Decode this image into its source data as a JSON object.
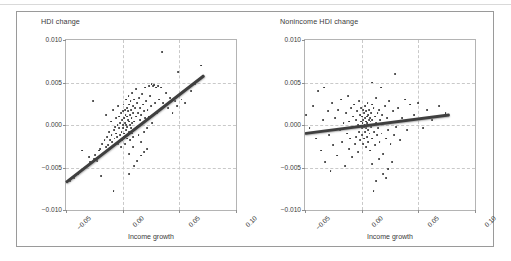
{
  "figure": {
    "border_color": "#9a9a9a",
    "background": "#ffffff",
    "point_color": "#2b2b2b",
    "trend_color": "#3f3f3f",
    "grid_color": "#c9c9c9"
  },
  "panels": [
    {
      "id": "hdi-change",
      "title": "HDI change",
      "xlabel": "Income growth",
      "yticks": [
        "0.010",
        "0.005",
        "0.000",
        "−0.005",
        "−0.010"
      ],
      "ytick_values": [
        0.01,
        0.005,
        0.0,
        -0.005,
        -0.01
      ],
      "xticks": [
        "−0.05",
        "0.00",
        "0.05",
        "0.10"
      ],
      "xtick_values": [
        -0.05,
        0.0,
        0.05,
        0.1
      ]
    },
    {
      "id": "nonincome-hdi-change",
      "title": "Nonincome HDI change",
      "xlabel": "Income growth",
      "yticks": [
        "0.010",
        "0.005",
        "0.000",
        "−0.005",
        "−0.010"
      ],
      "ytick_values": [
        0.01,
        0.005,
        0.0,
        -0.005,
        -0.01
      ],
      "xticks": [
        "−0.05",
        "0.00",
        "0.05",
        "0.10"
      ],
      "xtick_values": [
        -0.05,
        0.0,
        0.05,
        0.1
      ]
    }
  ],
  "chart_data": [
    {
      "type": "scatter",
      "title": "HDI change",
      "xlabel": "Income growth",
      "ylabel": "HDI change",
      "xlim": [
        -0.05,
        0.1
      ],
      "ylim": [
        -0.01,
        0.01
      ],
      "grid": true,
      "legend": "none",
      "trendline": {
        "x0": -0.05,
        "y0": -0.0068,
        "x1": 0.072,
        "y1": 0.0058
      },
      "points": [
        [
          -0.0465,
          -0.0066
        ],
        [
          -0.043,
          -0.0062
        ],
        [
          -0.0395,
          -0.0058
        ],
        [
          -0.036,
          -0.003
        ],
        [
          -0.0345,
          -0.0052
        ],
        [
          -0.031,
          -0.0048
        ],
        [
          -0.03,
          -0.0038
        ],
        [
          -0.0285,
          -0.0044
        ],
        [
          -0.0265,
          0.0028
        ],
        [
          -0.0255,
          -0.004
        ],
        [
          -0.024,
          -0.0035
        ],
        [
          -0.0225,
          -0.0042
        ],
        [
          -0.021,
          -0.003
        ],
        [
          -0.02,
          -0.0028
        ],
        [
          -0.019,
          -0.006
        ],
        [
          -0.018,
          -0.0022
        ],
        [
          -0.017,
          -0.0034
        ],
        [
          -0.016,
          -0.0018
        ],
        [
          -0.015,
          -0.0026
        ],
        [
          -0.0145,
          0.0012
        ],
        [
          -0.0135,
          -0.0014
        ],
        [
          -0.0128,
          -0.0024
        ],
        [
          -0.012,
          -0.0008
        ],
        [
          -0.0112,
          -0.0018
        ],
        [
          -0.0105,
          0.0004
        ],
        [
          -0.0098,
          -0.0012
        ],
        [
          -0.009,
          -0.002
        ],
        [
          -0.0085,
          0.0018
        ],
        [
          -0.0078,
          -0.0006
        ],
        [
          -0.0072,
          -0.0016
        ],
        [
          -0.0065,
          -0.0002
        ],
        [
          -0.006,
          -0.001
        ],
        [
          -0.0055,
          0.0008
        ],
        [
          -0.005,
          -0.0014
        ],
        [
          -0.0045,
          0.0
        ],
        [
          -0.004,
          -0.0022
        ],
        [
          -0.0038,
          0.0022
        ],
        [
          -0.0032,
          -0.0004
        ],
        [
          -0.0028,
          0.001
        ],
        [
          -0.0025,
          -0.0012
        ],
        [
          -0.002,
          0.0002
        ],
        [
          -0.0018,
          -0.0026
        ],
        [
          -0.0015,
          0.0014
        ],
        [
          -0.001,
          -0.0008
        ],
        [
          -0.0008,
          0.0006
        ],
        [
          -0.0005,
          -0.0018
        ],
        [
          0.0,
          0.0
        ],
        [
          0.0002,
          0.0016
        ],
        [
          0.0005,
          -0.0004
        ],
        [
          0.0008,
          0.0024
        ],
        [
          0.001,
          -0.0014
        ],
        [
          0.0012,
          0.0008
        ],
        [
          0.0015,
          -0.001
        ],
        [
          0.0018,
          0.0002
        ],
        [
          0.002,
          0.0018
        ],
        [
          0.0022,
          -0.0022
        ],
        [
          0.0025,
          0.0012
        ],
        [
          0.0028,
          -0.0006
        ],
        [
          0.003,
          0.003
        ],
        [
          0.0032,
          0.0
        ],
        [
          0.0035,
          -0.0016
        ],
        [
          0.0038,
          0.001
        ],
        [
          0.004,
          0.002
        ],
        [
          0.0042,
          -0.0002
        ],
        [
          0.0045,
          0.0006
        ],
        [
          0.0048,
          -0.0012
        ],
        [
          0.005,
          0.0016
        ],
        [
          0.0052,
          0.0034
        ],
        [
          0.0055,
          -0.0008
        ],
        [
          0.0058,
          0.0004
        ],
        [
          0.006,
          0.0024
        ],
        [
          0.0062,
          -0.0018
        ],
        [
          0.0065,
          0.0012
        ],
        [
          0.0068,
          0.0
        ],
        [
          0.007,
          0.0028
        ],
        [
          0.0072,
          -0.0004
        ],
        [
          0.0075,
          0.0018
        ],
        [
          0.0078,
          0.0008
        ],
        [
          0.008,
          -0.001
        ],
        [
          0.0082,
          0.0038
        ],
        [
          0.0085,
          0.0002
        ],
        [
          0.0088,
          0.0022
        ],
        [
          0.009,
          -0.0014
        ],
        [
          0.0095,
          0.0014
        ],
        [
          0.0098,
          0.003
        ],
        [
          0.01,
          0.0004
        ],
        [
          0.0105,
          -0.0006
        ],
        [
          0.011,
          0.002
        ],
        [
          0.0115,
          0.001
        ],
        [
          0.012,
          0.0042
        ],
        [
          0.0125,
          -0.0002
        ],
        [
          0.013,
          0.0026
        ],
        [
          0.0135,
          0.0014
        ],
        [
          0.014,
          -0.0012
        ],
        [
          0.0145,
          0.0032
        ],
        [
          0.015,
          0.0006
        ],
        [
          0.0155,
          0.002
        ],
        [
          0.016,
          -0.002
        ],
        [
          0.0165,
          0.0012
        ],
        [
          0.017,
          0.0036
        ],
        [
          0.0175,
          0.0002
        ],
        [
          0.018,
          0.0024
        ],
        [
          0.0185,
          -0.0008
        ],
        [
          0.019,
          0.0016
        ],
        [
          0.0195,
          0.0044
        ],
        [
          0.02,
          0.0008
        ],
        [
          0.021,
          0.0028
        ],
        [
          0.0215,
          -0.0004
        ],
        [
          0.022,
          0.0018
        ],
        [
          0.023,
          0.0046
        ],
        [
          0.0235,
          0.001
        ],
        [
          0.024,
          0.0034
        ],
        [
          0.025,
          0.0022
        ],
        [
          0.0255,
          0.0048
        ],
        [
          0.026,
          0.0002
        ],
        [
          0.027,
          0.0046
        ],
        [
          0.028,
          0.0047
        ],
        [
          0.0285,
          0.0026
        ],
        [
          0.0295,
          0.0044
        ],
        [
          0.03,
          0.0014
        ],
        [
          0.031,
          0.0046
        ],
        [
          0.032,
          0.003
        ],
        [
          0.033,
          0.0018
        ],
        [
          0.034,
          0.0044
        ],
        [
          0.035,
          0.0086
        ],
        [
          0.036,
          0.0026
        ],
        [
          0.038,
          0.0038
        ],
        [
          0.04,
          0.002
        ],
        [
          0.042,
          0.0032
        ],
        [
          0.044,
          0.0014
        ],
        [
          0.046,
          0.0028
        ],
        [
          0.048,
          0.0022
        ],
        [
          0.049,
          0.0062
        ],
        [
          0.052,
          0.003
        ],
        [
          0.055,
          0.0026
        ],
        [
          0.06,
          0.004
        ],
        [
          0.064,
          0.0048
        ],
        [
          0.069,
          0.007
        ],
        [
          -0.008,
          -0.0078
        ],
        [
          0.0055,
          -0.0058
        ],
        [
          0.01,
          -0.0048
        ],
        [
          0.0125,
          -0.0042
        ],
        [
          0.016,
          -0.0036
        ],
        [
          0.019,
          -0.0032
        ],
        [
          0.0215,
          -0.0028
        ],
        [
          0.006,
          -0.0034
        ],
        [
          0.009,
          -0.0026
        ]
      ]
    },
    {
      "type": "scatter",
      "title": "Nonincome HDI change",
      "xlabel": "Income growth",
      "ylabel": "Nonincome HDI change",
      "xlim": [
        -0.05,
        0.1
      ],
      "ylim": [
        -0.01,
        0.01
      ],
      "grid": true,
      "legend": "none",
      "trendline": {
        "x0": -0.05,
        "y0": -0.001,
        "x1": 0.078,
        "y1": 0.0012
      },
      "points": [
        [
          -0.049,
          0.0012
        ],
        [
          -0.046,
          -0.0004
        ],
        [
          -0.043,
          0.0022
        ],
        [
          -0.04,
          -0.0016
        ],
        [
          -0.0385,
          0.004
        ],
        [
          -0.036,
          -0.003
        ],
        [
          -0.034,
          0.0006
        ],
        [
          -0.0325,
          -0.0044
        ],
        [
          -0.03,
          0.0016
        ],
        [
          -0.0285,
          -0.0012
        ],
        [
          -0.0265,
          0.0026
        ],
        [
          -0.025,
          -0.0024
        ],
        [
          -0.0235,
          0.0008
        ],
        [
          -0.022,
          -0.0036
        ],
        [
          -0.0205,
          0.0018
        ],
        [
          -0.019,
          -0.0006
        ],
        [
          -0.018,
          0.003
        ],
        [
          -0.017,
          -0.002
        ],
        [
          -0.016,
          0.0002
        ],
        [
          -0.015,
          -0.0048
        ],
        [
          -0.014,
          0.0014
        ],
        [
          -0.013,
          -0.001
        ],
        [
          -0.0122,
          0.0034
        ],
        [
          -0.0115,
          -0.0028
        ],
        [
          -0.0108,
          0.0004
        ],
        [
          -0.01,
          -0.0016
        ],
        [
          -0.0092,
          0.002
        ],
        [
          -0.0085,
          -0.0038
        ],
        [
          -0.0078,
          0.001
        ],
        [
          -0.0072,
          -0.0002
        ],
        [
          -0.0065,
          0.0024
        ],
        [
          -0.0058,
          -0.0022
        ],
        [
          -0.0052,
          0.0006
        ],
        [
          -0.0046,
          -0.0014
        ],
        [
          -0.004,
          0.0016
        ],
        [
          -0.0035,
          -0.0032
        ],
        [
          -0.003,
          0.0
        ],
        [
          -0.0025,
          0.0028
        ],
        [
          -0.002,
          -0.0008
        ],
        [
          -0.0016,
          0.0012
        ],
        [
          -0.0012,
          -0.0018
        ],
        [
          -0.0008,
          0.0004
        ],
        [
          -0.0004,
          0.002
        ],
        [
          0.0,
          -0.0004
        ],
        [
          0.0002,
          0.001
        ],
        [
          0.0005,
          -0.0012
        ],
        [
          0.0008,
          0.0002
        ],
        [
          0.001,
          0.0018
        ],
        [
          0.0012,
          -0.0022
        ],
        [
          0.0015,
          0.0006
        ],
        [
          0.0018,
          -0.0002
        ],
        [
          0.002,
          0.0014
        ],
        [
          0.0022,
          -0.0016
        ],
        [
          0.0025,
          0.0
        ],
        [
          0.0028,
          0.0022
        ],
        [
          0.003,
          -0.0008
        ],
        [
          0.0032,
          0.0008
        ],
        [
          0.0035,
          -0.0026
        ],
        [
          0.0038,
          0.0004
        ],
        [
          0.004,
          0.0016
        ],
        [
          0.0042,
          -0.0004
        ],
        [
          0.0045,
          0.001
        ],
        [
          0.0048,
          -0.0014
        ],
        [
          0.005,
          0.0002
        ],
        [
          0.0052,
          0.0026
        ],
        [
          0.0055,
          -0.0006
        ],
        [
          0.0058,
          0.0012
        ],
        [
          0.006,
          -0.002
        ],
        [
          0.0062,
          0.0006
        ],
        [
          0.0065,
          0.0
        ],
        [
          0.0068,
          0.0018
        ],
        [
          0.007,
          -0.001
        ],
        [
          0.0072,
          0.0008
        ],
        [
          0.0075,
          -0.003
        ],
        [
          0.0078,
          0.0004
        ],
        [
          0.008,
          0.0014
        ],
        [
          0.0085,
          -0.0002
        ],
        [
          0.0088,
          0.0024
        ],
        [
          0.009,
          -0.0016
        ],
        [
          0.0095,
          0.0006
        ],
        [
          0.01,
          0.0
        ],
        [
          0.0105,
          0.002
        ],
        [
          0.011,
          -0.0008
        ],
        [
          0.0115,
          0.001
        ],
        [
          0.012,
          -0.0024
        ],
        [
          0.0125,
          0.0002
        ],
        [
          0.013,
          0.0032
        ],
        [
          0.0135,
          -0.0012
        ],
        [
          0.014,
          0.0014
        ],
        [
          0.0145,
          -0.0004
        ],
        [
          0.015,
          0.0018
        ],
        [
          0.0158,
          -0.002
        ],
        [
          0.0165,
          0.0006
        ],
        [
          0.017,
          0.0044
        ],
        [
          0.0175,
          -0.001
        ],
        [
          0.018,
          0.0012
        ],
        [
          0.019,
          -0.0034
        ],
        [
          0.02,
          0.0002
        ],
        [
          0.021,
          0.0022
        ],
        [
          0.0215,
          -0.0016
        ],
        [
          0.0225,
          0.0008
        ],
        [
          0.0235,
          -0.0006
        ],
        [
          0.0245,
          0.0028
        ],
        [
          0.0255,
          -0.0022
        ],
        [
          0.0265,
          0.0004
        ],
        [
          0.0275,
          0.0016
        ],
        [
          0.0285,
          -0.0012
        ],
        [
          0.0295,
          0.006
        ],
        [
          0.0305,
          -0.0002
        ],
        [
          0.032,
          0.002
        ],
        [
          0.034,
          -0.0018
        ],
        [
          0.036,
          0.0008
        ],
        [
          0.038,
          0.003
        ],
        [
          0.04,
          -0.0006
        ],
        [
          0.043,
          0.0024
        ],
        [
          0.046,
          0.0012
        ],
        [
          0.05,
          0.0026
        ],
        [
          0.054,
          -0.0004
        ],
        [
          0.058,
          0.0018
        ],
        [
          0.062,
          0.0006
        ],
        [
          0.068,
          0.0022
        ],
        [
          0.074,
          0.0014
        ],
        [
          0.013,
          -0.0066
        ],
        [
          0.019,
          -0.0058
        ],
        [
          0.023,
          -0.0052
        ],
        [
          0.009,
          -0.0046
        ],
        [
          0.0155,
          -0.004
        ],
        [
          0.0265,
          -0.0044
        ],
        [
          0.0105,
          -0.0078
        ],
        [
          0.0215,
          -0.0062
        ],
        [
          -0.0275,
          -0.0054
        ],
        [
          -0.033,
          0.0044
        ],
        [
          0.009,
          0.005
        ]
      ]
    }
  ]
}
